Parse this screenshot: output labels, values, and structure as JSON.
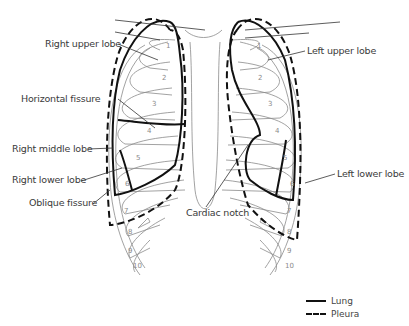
{
  "diagram": {
    "labels": {
      "right_upper_lobe": "Right upper lobe",
      "horizontal_fissure": "Horizontal fissure",
      "right_middle_lobe": "Right middle lobe",
      "right_lower_lobe": "Right lower lobe",
      "oblique_fissure": "Oblique fissure",
      "cardiac_notch": "Cardiac notch",
      "left_upper_lobe": "Left upper lobe",
      "left_lower_lobe": "Left lower lobe"
    },
    "rib_numbers_right": [
      "1",
      "2",
      "3",
      "4",
      "5",
      "6",
      "7",
      "8",
      "9",
      "10"
    ],
    "rib_numbers_left": [
      "1",
      "2",
      "3",
      "4",
      "5",
      "6",
      "7",
      "8",
      "9",
      "10"
    ],
    "colors": {
      "lung_line": "#111111",
      "pleura_line": "#111111",
      "rib_line": "#8a8a8a",
      "label_text": "#3a3a3a"
    }
  },
  "legend": {
    "items": [
      {
        "label": "Lung",
        "style": "solid"
      },
      {
        "label": "Pleura",
        "style": "dashed"
      }
    ]
  }
}
